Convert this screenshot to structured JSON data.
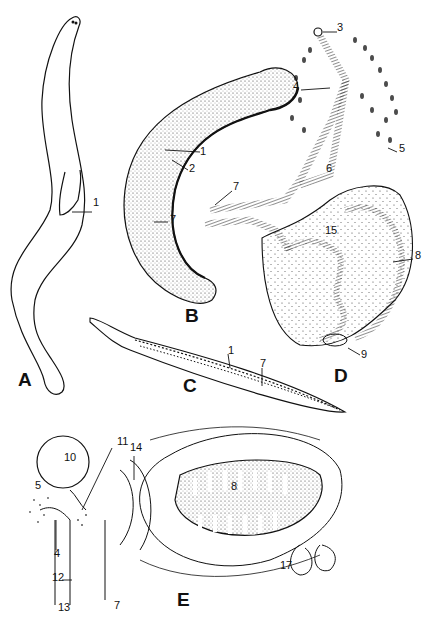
{
  "figure": {
    "panels": [
      {
        "id": "A",
        "label": "A",
        "x": 18,
        "y": 370,
        "callouts": [
          {
            "text": "1",
            "x": 93,
            "y": 203
          }
        ]
      },
      {
        "id": "B",
        "label": "B",
        "x": 185,
        "y": 306,
        "callouts": [
          {
            "text": "1",
            "x": 200,
            "y": 152
          },
          {
            "text": "2",
            "x": 189,
            "y": 169
          },
          {
            "text": "7",
            "x": 170,
            "y": 220
          }
        ]
      },
      {
        "id": "C",
        "label": "C",
        "x": 183,
        "y": 376,
        "callouts": [
          {
            "text": "1",
            "x": 228,
            "y": 351
          },
          {
            "text": "7",
            "x": 260,
            "y": 364
          }
        ]
      },
      {
        "id": "D",
        "label": "D",
        "x": 334,
        "y": 366,
        "callouts": [
          {
            "text": "3",
            "x": 337,
            "y": 28
          },
          {
            "text": "4",
            "x": 293,
            "y": 87
          },
          {
            "text": "5",
            "x": 399,
            "y": 149
          },
          {
            "text": "6",
            "x": 326,
            "y": 169
          },
          {
            "text": "7",
            "x": 233,
            "y": 187
          },
          {
            "text": "15",
            "x": 325,
            "y": 231
          },
          {
            "text": "8",
            "x": 415,
            "y": 256
          },
          {
            "text": "9",
            "x": 361,
            "y": 355
          }
        ]
      },
      {
        "id": "E",
        "label": "E",
        "x": 177,
        "y": 590,
        "callouts": [
          {
            "text": "10",
            "x": 64,
            "y": 458
          },
          {
            "text": "11",
            "x": 117,
            "y": 442
          },
          {
            "text": "14",
            "x": 130,
            "y": 448
          },
          {
            "text": "5",
            "x": 35,
            "y": 486
          },
          {
            "text": "4",
            "x": 54,
            "y": 554
          },
          {
            "text": "12",
            "x": 52,
            "y": 578
          },
          {
            "text": "13",
            "x": 58,
            "y": 608
          },
          {
            "text": "7",
            "x": 114,
            "y": 606
          },
          {
            "text": "8",
            "x": 231,
            "y": 487
          },
          {
            "text": "17",
            "x": 280,
            "y": 566
          }
        ]
      }
    ]
  }
}
